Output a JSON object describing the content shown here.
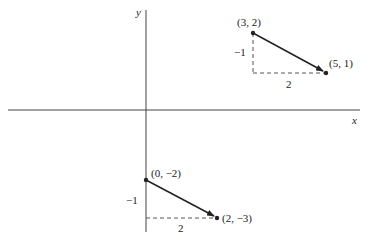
{
  "axes": {
    "x_label": "x",
    "y_label": "y"
  },
  "vectors": [
    {
      "start_label": "(3, 2)",
      "end_label": "(5, 1)",
      "rise_label": "−1",
      "run_label": "2"
    },
    {
      "start_label": "(0, −2)",
      "end_label": "(2, −3)",
      "rise_label": "−1",
      "run_label": "2"
    }
  ],
  "colors": {
    "line": "#222222",
    "dashed": "#555555",
    "axis": "#444444"
  }
}
